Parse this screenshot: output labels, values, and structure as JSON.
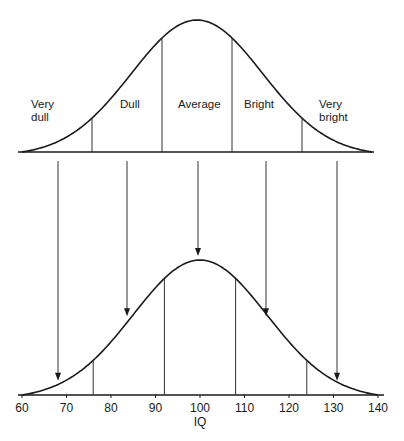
{
  "chart_data": {
    "type": "line",
    "title": "",
    "xlabel": "IQ",
    "ylabel": "",
    "xlim": [
      60,
      140
    ],
    "x_ticks": [
      60,
      70,
      80,
      90,
      100,
      110,
      120,
      130,
      140
    ],
    "grid": false,
    "legend": null,
    "distribution": {
      "kind": "normal",
      "mean": 100,
      "sd": 15
    },
    "top_curve": {
      "description": "Schematic normal curve with category regions (no axis)",
      "boundaries": [
        76,
        92,
        108,
        124
      ],
      "categories": [
        {
          "label_lines": [
            "Very",
            "dull"
          ],
          "range": [
            60,
            76
          ]
        },
        {
          "label_lines": [
            "Dull"
          ],
          "range": [
            76,
            92
          ]
        },
        {
          "label_lines": [
            "Average"
          ],
          "range": [
            92,
            108
          ]
        },
        {
          "label_lines": [
            "Bright"
          ],
          "range": [
            108,
            124
          ]
        },
        {
          "label_lines": [
            "Very",
            "bright"
          ],
          "range": [
            124,
            140
          ]
        }
      ]
    },
    "bottom_curve": {
      "description": "Normal IQ distribution with the same boundaries mapped onto IQ scale",
      "boundaries": [
        76,
        92,
        108,
        124
      ]
    },
    "arrows": [
      {
        "from_category": "Very dull",
        "to_iq": 68
      },
      {
        "from_category": "Dull",
        "to_iq": 84
      },
      {
        "from_category": "Average",
        "to_iq": 100
      },
      {
        "from_category": "Bright",
        "to_iq": 116
      },
      {
        "from_category": "Very bright",
        "to_iq": 132
      }
    ]
  }
}
